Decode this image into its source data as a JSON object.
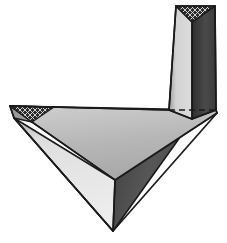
{
  "figure": {
    "title": "Two joined triangular prisms forming an L-shaped elbow",
    "canvas": {
      "width": 227,
      "height": 243,
      "background": "#ffffff"
    },
    "colors": {
      "background": "#ffffff",
      "outline": "#1a1a1a",
      "top_face_light": "#b9b9b9",
      "lower_left_face": "#d6d6d6",
      "right_face_dark": "#4f4f4f",
      "vertical_left_face": "#c7c7c7",
      "vertical_right_face": "#3a3a3a",
      "hatch_fill": "#2b2b2b",
      "hatch_line": "#e8e8e8",
      "hidden_edge": "#1a1a1a"
    },
    "stroke_widths": {
      "outline": 1.6,
      "interior_edge": 1.4,
      "hidden_edge": 1.6
    },
    "hidden_edge": {
      "label": "hidden-edge-dashed",
      "dash_pattern": "6 4",
      "x1": 169,
      "y1": 110,
      "x2": 216,
      "y2": 110
    },
    "parts": [
      {
        "id": "horizontal-prism",
        "label": "Horizontal triangular prism",
        "faces": [
          {
            "id": "top-face",
            "label": "Top face",
            "shade": "light-gray",
            "color": "#b9b9b9"
          },
          {
            "id": "lower-left-face",
            "label": "Lower left face",
            "shade": "pale-gray",
            "color": "#d6d6d6"
          },
          {
            "id": "right-face",
            "label": "Right face",
            "shade": "dark-gray",
            "color": "#4f4f4f"
          },
          {
            "id": "left-end-cap",
            "label": "Left end cap",
            "shade": "cross-hatched",
            "color": "#2b2b2b"
          }
        ]
      },
      {
        "id": "vertical-prism",
        "label": "Vertical triangular prism",
        "faces": [
          {
            "id": "vertical-left-face",
            "label": "Vertical left face",
            "shade": "light-gray",
            "color": "#c7c7c7"
          },
          {
            "id": "vertical-right-face",
            "label": "Vertical right face",
            "shade": "dark-gray",
            "color": "#3a3a3a"
          },
          {
            "id": "top-end-cap",
            "label": "Top end cap",
            "shade": "cross-hatched",
            "color": "#2b2b2b"
          }
        ]
      }
    ],
    "vertices": {
      "horiz_left_tip_top": [
        10,
        106
      ],
      "horiz_left_tip_low": [
        14,
        118
      ],
      "horiz_bottom_apex": [
        113,
        231
      ],
      "horiz_right_tip": [
        217,
        113
      ],
      "horiz_ridge_mid": [
        115,
        180
      ],
      "joint_top_left": [
        169,
        110
      ],
      "joint_top_right": [
        216,
        110
      ],
      "vert_top_left": [
        176,
        6
      ],
      "vert_top_apex": [
        192,
        22
      ],
      "vert_top_right": [
        215,
        6
      ],
      "vert_front_edge_bottom": [
        192,
        119
      ]
    }
  }
}
